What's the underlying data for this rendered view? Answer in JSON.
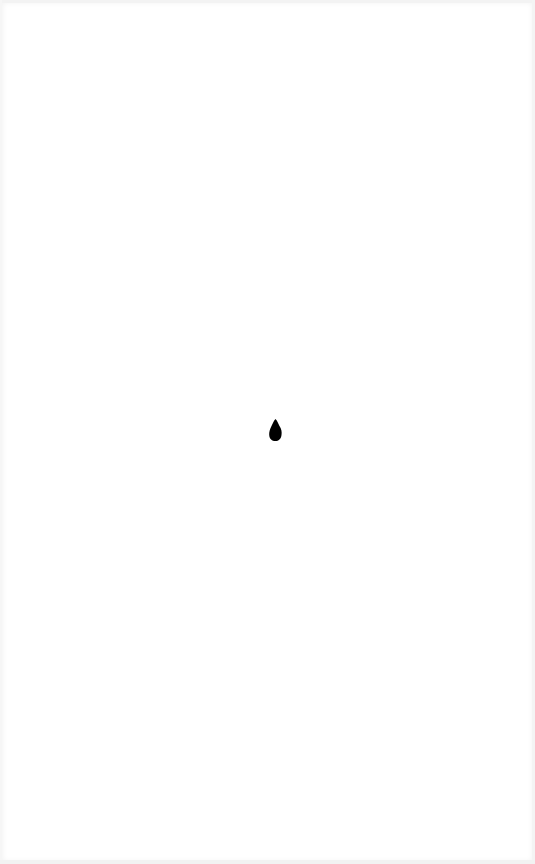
{
  "page": {
    "background_color": "#ffffff",
    "border_tint": "#f0f0f0"
  },
  "indicator": {
    "icon": "drop-icon",
    "color": "#000000"
  }
}
